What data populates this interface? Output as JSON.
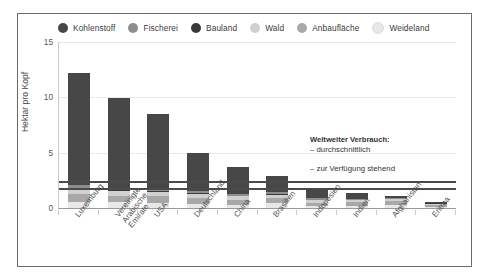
{
  "chart_data": {
    "type": "bar",
    "stacked": true,
    "title": "",
    "subtitle": "",
    "xlabel": "",
    "ylabel": "Hektar pro Kopf",
    "ylim": [
      0,
      15
    ],
    "yticks": [
      0,
      5,
      10,
      15
    ],
    "grid": true,
    "legend_position": "top",
    "categories": [
      "Luxemburg",
      "Vereinigte\nArabische\nEmirate",
      "USA",
      "Deutschland",
      "China",
      "Brasilien",
      "Indonesien",
      "Indien",
      "Afghanistan",
      "Eritrea"
    ],
    "series": [
      {
        "name": "Weideland",
        "color": "#e8e8e8",
        "values": [
          0.55,
          0.5,
          0.45,
          0.35,
          0.25,
          0.45,
          0.15,
          0.15,
          0.3,
          0.1
        ]
      },
      {
        "name": "Anbaufläche",
        "color": "#a8a8a8",
        "values": [
          0.7,
          0.6,
          0.6,
          0.55,
          0.5,
          0.45,
          0.3,
          0.35,
          0.35,
          0.2
        ]
      },
      {
        "name": "Wald",
        "color": "#d0d0d0",
        "values": [
          0.45,
          0.4,
          0.4,
          0.35,
          0.3,
          0.3,
          0.25,
          0.2,
          0.15,
          0.1
        ]
      },
      {
        "name": "Bauland",
        "color": "#3a3a3a",
        "values": [
          0.1,
          0.1,
          0.1,
          0.08,
          0.07,
          0.06,
          0.05,
          0.05,
          0.04,
          0.03
        ]
      },
      {
        "name": "Fischerei",
        "color": "#8e8e8e",
        "values": [
          0.25,
          0.25,
          0.25,
          0.2,
          0.18,
          0.15,
          0.12,
          0.1,
          0.08,
          0.05
        ]
      },
      {
        "name": "Kohlenstoff",
        "color": "#474747",
        "values": [
          10.15,
          8.05,
          6.7,
          3.47,
          2.4,
          1.49,
          0.73,
          0.55,
          0.18,
          0.07
        ]
      }
    ],
    "reference_lines": [
      {
        "label": "durchschnittlich",
        "value": 2.4
      },
      {
        "label": "zur Verfügung stehend",
        "value": 1.8
      }
    ],
    "annotation": {
      "title": "Weltweiter Verbrauch:",
      "line1": "– durchschnittlich",
      "line2": "– zur Verfügung stehend"
    }
  },
  "legend": {
    "items": [
      {
        "label": "Kohlenstoff",
        "color": "#474747"
      },
      {
        "label": "Fischerei",
        "color": "#8e8e8e"
      },
      {
        "label": "Bauland",
        "color": "#3a3a3a"
      },
      {
        "label": "Wald",
        "color": "#d0d0d0"
      },
      {
        "label": "Anbaufläche",
        "color": "#a8a8a8"
      },
      {
        "label": "Weideland",
        "color": "#e8e8e8"
      }
    ]
  }
}
